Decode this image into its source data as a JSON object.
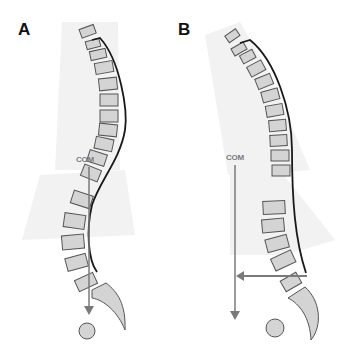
{
  "figure": {
    "panels": [
      {
        "id": "A",
        "label": "A",
        "com_label": "COM",
        "posture": "balanced sagittal alignment; COM plumb line falls over sacrum"
      },
      {
        "id": "B",
        "label": "B",
        "com_label": "COM",
        "posture": "forward sagittal imbalance; COM plumb line anterior to sacrum with horizontal offset arrow"
      }
    ],
    "colors": {
      "vertebra_fill": "#d4d4d4",
      "vertebra_stroke": "#555555",
      "curve": "#1a1a1a",
      "arrow": "#7a7a7a",
      "background_shade": "#f2f2f2"
    }
  }
}
